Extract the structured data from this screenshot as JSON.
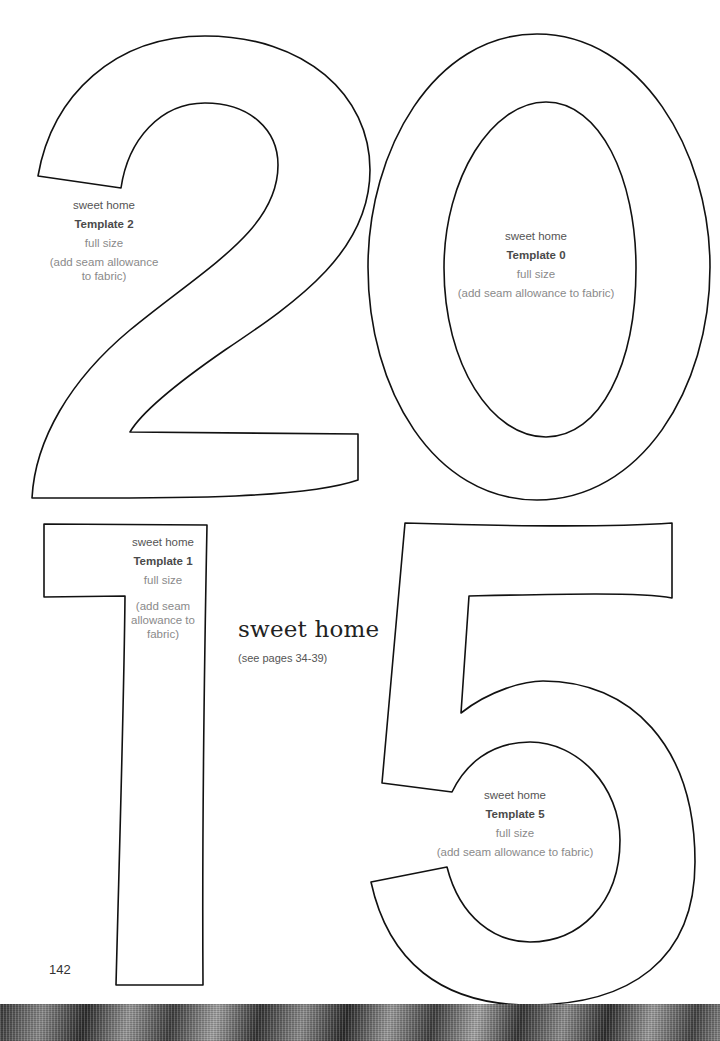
{
  "page": {
    "page_number": "142",
    "title": "sweet home",
    "subtitle": "(see pages 34-39)"
  },
  "templates": [
    {
      "digit": "2",
      "project": "sweet home",
      "name": "Template 2",
      "size": "full size",
      "note": "(add seam allowance to fabric)"
    },
    {
      "digit": "0",
      "project": "sweet home",
      "name": "Template 0",
      "size": "full size",
      "note": "(add seam allowance to fabric)"
    },
    {
      "digit": "1",
      "project": "sweet home",
      "name": "Template 1",
      "size": "full size",
      "note": "(add seam allowance to fabric)"
    },
    {
      "digit": "5",
      "project": "sweet home",
      "name": "Template 5",
      "size": "full size",
      "note": "(add seam allowance to fabric)"
    }
  ],
  "colors": {
    "outline": "#111111",
    "background": "#ffffff",
    "label_text": "#6f6f6f",
    "label_bold": "#4a4a4a"
  }
}
